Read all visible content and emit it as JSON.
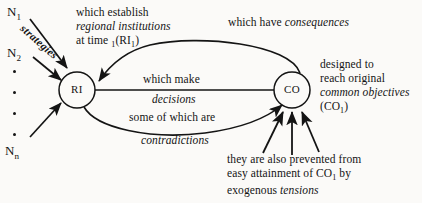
{
  "diagram": {
    "background_color": "#fbfaf8",
    "ink_color": "#141414",
    "nodes": [
      {
        "id": "RI",
        "label": "RI",
        "cx": 77,
        "cy": 90,
        "r": 18
      },
      {
        "id": "CO",
        "label": "CO",
        "cx": 292,
        "cy": 90,
        "r": 18
      }
    ],
    "inputs": {
      "first": "N",
      "first_sub": "1",
      "second": "N",
      "second_sub": "2",
      "last": "N",
      "last_sub": "n",
      "ellipsis_count": 4,
      "arrow_label": "strategies"
    },
    "annotations": {
      "establish": {
        "line1": "which establish",
        "line2": "regional institutions",
        "line3_pre": "at time ",
        "line3_sub": "1",
        "line3_post": "(RI",
        "line3_sub2": "1",
        "line3_end": ")"
      },
      "consequences": {
        "plain": "which have ",
        "italic": "consequences"
      },
      "objectives": {
        "line1": "designed to",
        "line2": "reach original",
        "line3": "common objectives",
        "line4_pre": "(CO",
        "line4_sub": "1",
        "line4_post": ")"
      },
      "decisions": {
        "line1": "which make",
        "line2": "decisions",
        "line3": "some of which are",
        "line4": "contradictions"
      },
      "tensions": {
        "line1": "they are also prevented from",
        "line2_pre": "easy attainment of CO",
        "line2_sub": "1",
        "line2_post": " by",
        "line3_plain": "exogenous ",
        "line3_italic": "tensions"
      }
    }
  }
}
